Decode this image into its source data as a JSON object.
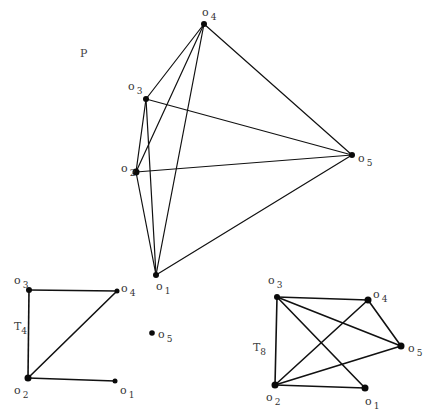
{
  "graphs": [
    {
      "id": "P",
      "title": "P",
      "title_pos": [
        80,
        57
      ],
      "title_sub": "",
      "nodes": [
        {
          "id": "o1",
          "base": "o",
          "sub": "1",
          "x": 156,
          "y": 275,
          "r": 3,
          "label_x": 156,
          "label_y": 290
        },
        {
          "id": "o2",
          "base": "o",
          "sub": "2",
          "x": 136,
          "y": 172,
          "r": 3.5,
          "label_x": 121,
          "label_y": 172
        },
        {
          "id": "o3",
          "base": "o",
          "sub": "3",
          "x": 146,
          "y": 99,
          "r": 3,
          "label_x": 128,
          "label_y": 90
        },
        {
          "id": "o4",
          "base": "o",
          "sub": "4",
          "x": 204,
          "y": 24,
          "r": 3,
          "label_x": 202,
          "label_y": 16
        },
        {
          "id": "o5",
          "base": "o",
          "sub": "5",
          "x": 352,
          "y": 155,
          "r": 3,
          "label_x": 358,
          "label_y": 162
        }
      ],
      "edges": [
        [
          "o4",
          "o3"
        ],
        [
          "o4",
          "o2"
        ],
        [
          "o4",
          "o1"
        ],
        [
          "o4",
          "o5"
        ],
        [
          "o3",
          "o5"
        ],
        [
          "o3",
          "o2"
        ],
        [
          "o3",
          "o1"
        ],
        [
          "o2",
          "o5"
        ],
        [
          "o2",
          "o1"
        ],
        [
          "o1",
          "o5"
        ]
      ]
    },
    {
      "id": "T4",
      "title": "T",
      "title_sub": "4",
      "title_pos": [
        14,
        330
      ],
      "nodes": [
        {
          "id": "o1",
          "base": "o",
          "sub": "1",
          "x": 115,
          "y": 381,
          "r": 2.5,
          "label_x": 120,
          "label_y": 394
        },
        {
          "id": "o2",
          "base": "o",
          "sub": "2",
          "x": 28,
          "y": 378,
          "r": 3.5,
          "label_x": 14,
          "label_y": 394
        },
        {
          "id": "o3",
          "base": "o",
          "sub": "3",
          "x": 29,
          "y": 290,
          "r": 3,
          "label_x": 14,
          "label_y": 284
        },
        {
          "id": "o4",
          "base": "o",
          "sub": "4",
          "x": 117,
          "y": 291,
          "r": 2.5,
          "label_x": 121,
          "label_y": 292
        },
        {
          "id": "o5",
          "base": "o",
          "sub": "5",
          "x": 152,
          "y": 333,
          "r": 2.8,
          "label_x": 158,
          "label_y": 338
        }
      ],
      "edges": [
        [
          "o3",
          "o4"
        ],
        [
          "o3",
          "o2"
        ],
        [
          "o4",
          "o2"
        ],
        [
          "o2",
          "o1"
        ]
      ]
    },
    {
      "id": "T8",
      "title": "T",
      "title_sub": "8",
      "title_pos": [
        253,
        351
      ],
      "nodes": [
        {
          "id": "o1",
          "base": "o",
          "sub": "1",
          "x": 365,
          "y": 388,
          "r": 3.5,
          "label_x": 365,
          "label_y": 405
        },
        {
          "id": "o2",
          "base": "o",
          "sub": "2",
          "x": 275,
          "y": 385,
          "r": 3.5,
          "label_x": 266,
          "label_y": 401
        },
        {
          "id": "o3",
          "base": "o",
          "sub": "3",
          "x": 277,
          "y": 297,
          "r": 3,
          "label_x": 268,
          "label_y": 284
        },
        {
          "id": "o4",
          "base": "o",
          "sub": "4",
          "x": 368,
          "y": 300,
          "r": 3.5,
          "label_x": 373,
          "label_y": 298
        },
        {
          "id": "o5",
          "base": "o",
          "sub": "5",
          "x": 401,
          "y": 346,
          "r": 3.5,
          "label_x": 408,
          "label_y": 352
        }
      ],
      "edges": [
        [
          "o3",
          "o4"
        ],
        [
          "o3",
          "o5"
        ],
        [
          "o3",
          "o1"
        ],
        [
          "o3",
          "o2"
        ],
        [
          "o4",
          "o2"
        ],
        [
          "o4",
          "o5"
        ],
        [
          "o5",
          "o2"
        ],
        [
          "o2",
          "o1"
        ]
      ]
    }
  ],
  "colors": {
    "edge": "#111111",
    "node": "#0a0a0a",
    "label": "#333333",
    "background": "#ffffff"
  }
}
